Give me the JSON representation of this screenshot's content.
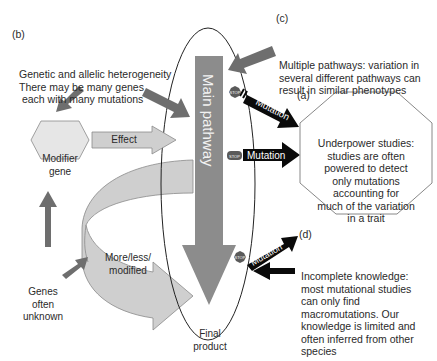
{
  "panels": {
    "b": {
      "tag": "(b)",
      "lines": [
        "Genetic and allelic heterogeneity",
        "There may be many genes",
        " each with many mutations"
      ]
    },
    "c": {
      "tag": "(c)",
      "lines": [
        "Multiple pathways: variation in",
        "several different pathways can",
        "result in similar phenotypes"
      ]
    },
    "a": {
      "tag": "(a)",
      "lines": [
        "Underpower studies:",
        "studies are often",
        "powered to detect",
        "only mutations",
        "accounting for",
        "much of the variation",
        "in a trait"
      ]
    },
    "d": {
      "tag": "(d)",
      "lines": [
        "Incomplete knowledge:",
        "most mutational studies",
        "can only find",
        "macromutations. Our",
        "knowledge is limited and",
        "often inferred from other",
        "species"
      ]
    }
  },
  "nodes": {
    "main_pathway": "Main pathway",
    "modifier_gene": [
      "Modifier",
      "gene"
    ],
    "effect": "Effect",
    "more_less": [
      "More/less/",
      "modified"
    ],
    "genes_unknown": [
      "Genes",
      "often",
      "unknown"
    ],
    "final_product": [
      "Final",
      "product"
    ]
  },
  "mutations": {
    "label": "Mutation",
    "stop_label": "STOP"
  },
  "colors": {
    "main_bar": "#8c8c8c",
    "dark_arrow": "#6e6e6e",
    "light_arrow": "#cfcfcf",
    "hexagon_fill": "#e6e6e6",
    "mutation_arrow": "#0a0a0a",
    "stop_sign": "#5a5a5a"
  }
}
